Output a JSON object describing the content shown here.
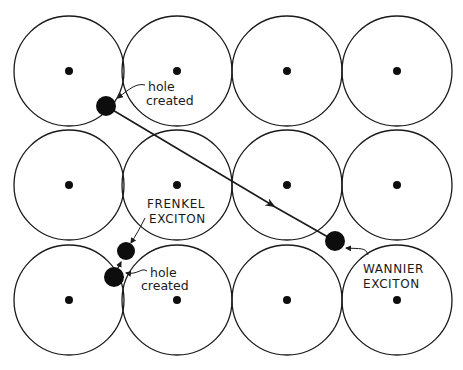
{
  "diagram": {
    "lattice": {
      "columns_x": [
        69,
        177,
        287,
        397
      ],
      "rows_y": [
        71,
        185,
        300
      ],
      "radius": 55,
      "nucleus_radius": 4
    },
    "wannier": {
      "hole": {
        "x": 106,
        "y": 106,
        "r": 10
      },
      "electron": {
        "x": 335,
        "y": 241,
        "r": 10
      },
      "hole_label": [
        "hole",
        "created"
      ],
      "exciton_label": [
        "WANNIER",
        "EXCITON"
      ]
    },
    "frenkel": {
      "electron": {
        "x": 126,
        "y": 251,
        "r": 9
      },
      "hole": {
        "x": 114,
        "y": 277,
        "r": 10
      },
      "hole_label": [
        "hole",
        "created"
      ],
      "exciton_label": [
        "FRENKEL",
        "EXCITON"
      ]
    },
    "colors": {
      "line": "#1a1a1a",
      "fill": "#0d0d0d",
      "background": "#ffffff"
    }
  }
}
